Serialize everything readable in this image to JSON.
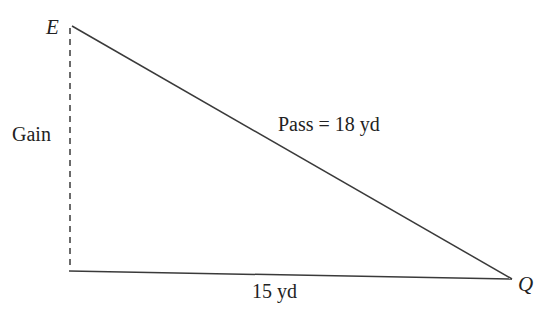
{
  "diagram": {
    "type": "right-triangle",
    "vertices": {
      "top": {
        "label": "E"
      },
      "right": {
        "label": "Q"
      }
    },
    "sides": {
      "hypotenuse": {
        "label": "Pass = 18 yd"
      },
      "base": {
        "label": "15 yd"
      },
      "vertical": {
        "label": "Gain",
        "style": "dashed"
      }
    },
    "colors": {
      "line": "#3a3a3a",
      "text": "#222222",
      "background": "#ffffff"
    }
  }
}
